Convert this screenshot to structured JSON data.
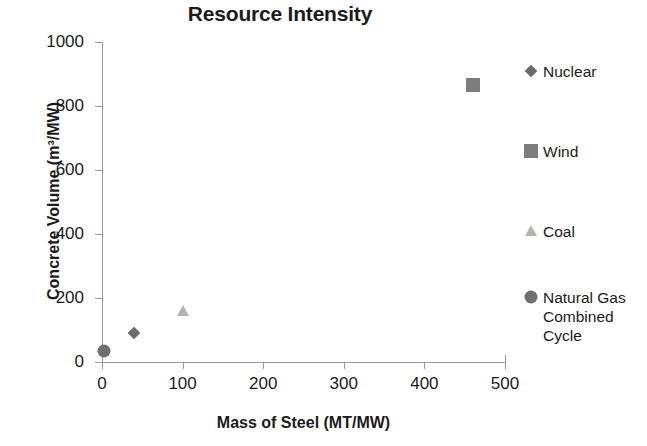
{
  "chart_data": {
    "type": "scatter",
    "title": "Resource Intensity",
    "xlabel": "Mass of Steel (MT/MW)",
    "ylabel": "Concrete Volume (m³/MW)",
    "xlim": [
      0,
      500
    ],
    "ylim": [
      0,
      1000
    ],
    "xticks": [
      "0",
      "100",
      "200",
      "300",
      "400",
      "500"
    ],
    "xtick_values": [
      0,
      100,
      200,
      300,
      400,
      500
    ],
    "yticks": [
      "0",
      "200",
      "400",
      "600",
      "800",
      "1000"
    ],
    "ytick_values": [
      0,
      200,
      400,
      600,
      800,
      1000
    ],
    "grid": false,
    "legend_position": "right",
    "series": [
      {
        "name": "Nuclear",
        "marker": "diamond",
        "color": "#6b6b6b",
        "x": [
          40
        ],
        "y": [
          92
        ]
      },
      {
        "name": "Wind",
        "marker": "square",
        "color": "#7d7d7d",
        "x": [
          460
        ],
        "y": [
          865
        ]
      },
      {
        "name": "Coal",
        "marker": "triangle",
        "color": "#b4b4b4",
        "x": [
          100
        ],
        "y": [
          160
        ]
      },
      {
        "name": "Natural Gas Combined Cycle",
        "marker": "circle",
        "color": "#6e6e6e",
        "x": [
          2
        ],
        "y": [
          35
        ]
      }
    ]
  },
  "legend": {
    "entries": [
      {
        "label": "Nuclear",
        "marker": "diamond-marker-icon"
      },
      {
        "label": "Wind",
        "marker": "square-marker-icon"
      },
      {
        "label": "Coal",
        "marker": "triangle-marker-icon"
      },
      {
        "label": "Natural Gas Combined Cycle",
        "marker": "circle-marker-icon"
      }
    ]
  },
  "caption": {
    "sliver_text": " "
  }
}
